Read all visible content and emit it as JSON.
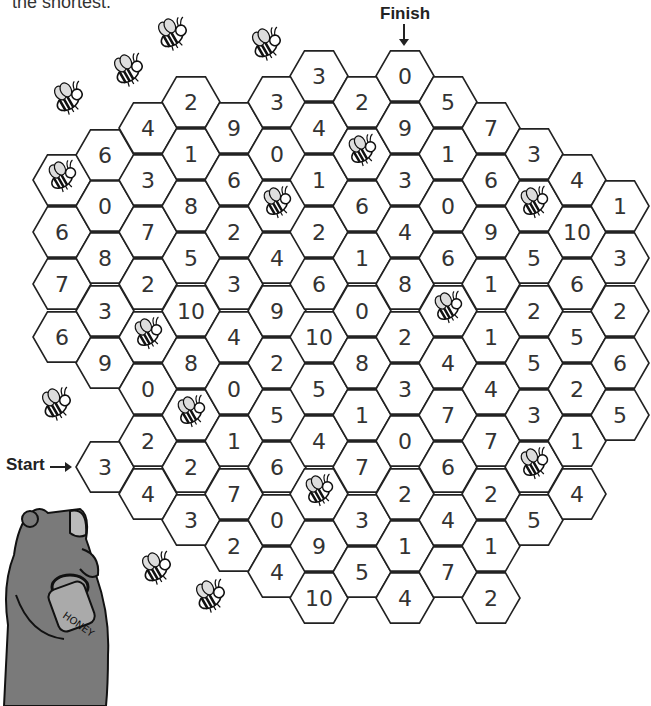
{
  "instructions_fragment": "the shortest.",
  "labels": {
    "finish": "Finish",
    "start": "Start"
  },
  "colors": {
    "hex_stroke": "#222222",
    "bear": "#7a7a7a",
    "text": "#333333"
  },
  "grid": {
    "hex_radius": 29,
    "cells": [
      {
        "x": 62,
        "y": 180,
        "v": "bee"
      },
      {
        "x": 62,
        "y": 232,
        "v": "6"
      },
      {
        "x": 62,
        "y": 284,
        "v": "7"
      },
      {
        "x": 62,
        "y": 337,
        "v": "6"
      },
      {
        "x": 105,
        "y": 155,
        "v": "6"
      },
      {
        "x": 105,
        "y": 206,
        "v": "0"
      },
      {
        "x": 105,
        "y": 258,
        "v": "8"
      },
      {
        "x": 105,
        "y": 311,
        "v": "3"
      },
      {
        "x": 105,
        "y": 363,
        "v": "9"
      },
      {
        "x": 105,
        "y": 467,
        "v": "3",
        "role": "start"
      },
      {
        "x": 148,
        "y": 128,
        "v": "4"
      },
      {
        "x": 148,
        "y": 180,
        "v": "3"
      },
      {
        "x": 148,
        "y": 232,
        "v": "7"
      },
      {
        "x": 148,
        "y": 284,
        "v": "2"
      },
      {
        "x": 148,
        "y": 337,
        "v": "bee"
      },
      {
        "x": 148,
        "y": 389,
        "v": "0"
      },
      {
        "x": 148,
        "y": 441,
        "v": "2"
      },
      {
        "x": 148,
        "y": 494,
        "v": "4"
      },
      {
        "x": 191,
        "y": 102,
        "v": "2"
      },
      {
        "x": 191,
        "y": 154,
        "v": "1"
      },
      {
        "x": 191,
        "y": 206,
        "v": "8"
      },
      {
        "x": 191,
        "y": 258,
        "v": "5"
      },
      {
        "x": 191,
        "y": 311,
        "v": "10"
      },
      {
        "x": 191,
        "y": 363,
        "v": "8"
      },
      {
        "x": 191,
        "y": 415,
        "v": "bee"
      },
      {
        "x": 191,
        "y": 467,
        "v": "2"
      },
      {
        "x": 191,
        "y": 520,
        "v": "3"
      },
      {
        "x": 234,
        "y": 128,
        "v": "9"
      },
      {
        "x": 234,
        "y": 180,
        "v": "6"
      },
      {
        "x": 234,
        "y": 232,
        "v": "2"
      },
      {
        "x": 234,
        "y": 284,
        "v": "3"
      },
      {
        "x": 234,
        "y": 337,
        "v": "4"
      },
      {
        "x": 234,
        "y": 389,
        "v": "0"
      },
      {
        "x": 234,
        "y": 441,
        "v": "1"
      },
      {
        "x": 234,
        "y": 494,
        "v": "7"
      },
      {
        "x": 234,
        "y": 546,
        "v": "2"
      },
      {
        "x": 277,
        "y": 102,
        "v": "3"
      },
      {
        "x": 277,
        "y": 154,
        "v": "0"
      },
      {
        "x": 277,
        "y": 206,
        "v": "bee"
      },
      {
        "x": 277,
        "y": 258,
        "v": "4"
      },
      {
        "x": 277,
        "y": 311,
        "v": "9"
      },
      {
        "x": 277,
        "y": 363,
        "v": "2"
      },
      {
        "x": 277,
        "y": 415,
        "v": "5"
      },
      {
        "x": 277,
        "y": 467,
        "v": "6"
      },
      {
        "x": 277,
        "y": 520,
        "v": "0"
      },
      {
        "x": 277,
        "y": 572,
        "v": "4"
      },
      {
        "x": 319,
        "y": 76,
        "v": "3"
      },
      {
        "x": 319,
        "y": 128,
        "v": "4"
      },
      {
        "x": 319,
        "y": 180,
        "v": "1"
      },
      {
        "x": 319,
        "y": 232,
        "v": "2"
      },
      {
        "x": 319,
        "y": 284,
        "v": "6"
      },
      {
        "x": 319,
        "y": 337,
        "v": "10"
      },
      {
        "x": 319,
        "y": 389,
        "v": "5"
      },
      {
        "x": 319,
        "y": 441,
        "v": "4"
      },
      {
        "x": 319,
        "y": 494,
        "v": "bee"
      },
      {
        "x": 319,
        "y": 546,
        "v": "9"
      },
      {
        "x": 319,
        "y": 598,
        "v": "10"
      },
      {
        "x": 362,
        "y": 102,
        "v": "2"
      },
      {
        "x": 362,
        "y": 154,
        "v": "bee"
      },
      {
        "x": 362,
        "y": 206,
        "v": "6"
      },
      {
        "x": 362,
        "y": 258,
        "v": "1"
      },
      {
        "x": 362,
        "y": 311,
        "v": "0"
      },
      {
        "x": 362,
        "y": 363,
        "v": "8"
      },
      {
        "x": 362,
        "y": 415,
        "v": "1"
      },
      {
        "x": 362,
        "y": 467,
        "v": "7"
      },
      {
        "x": 362,
        "y": 520,
        "v": "3"
      },
      {
        "x": 362,
        "y": 572,
        "v": "5"
      },
      {
        "x": 405,
        "y": 76,
        "v": "0",
        "role": "finish"
      },
      {
        "x": 405,
        "y": 128,
        "v": "9"
      },
      {
        "x": 405,
        "y": 180,
        "v": "3"
      },
      {
        "x": 405,
        "y": 232,
        "v": "4"
      },
      {
        "x": 405,
        "y": 284,
        "v": "8"
      },
      {
        "x": 405,
        "y": 337,
        "v": "2"
      },
      {
        "x": 405,
        "y": 389,
        "v": "3"
      },
      {
        "x": 405,
        "y": 441,
        "v": "0"
      },
      {
        "x": 405,
        "y": 494,
        "v": "2"
      },
      {
        "x": 405,
        "y": 546,
        "v": "1"
      },
      {
        "x": 405,
        "y": 598,
        "v": "4"
      },
      {
        "x": 448,
        "y": 102,
        "v": "5"
      },
      {
        "x": 448,
        "y": 154,
        "v": "1"
      },
      {
        "x": 448,
        "y": 206,
        "v": "0"
      },
      {
        "x": 448,
        "y": 258,
        "v": "6"
      },
      {
        "x": 448,
        "y": 311,
        "v": "bee"
      },
      {
        "x": 448,
        "y": 363,
        "v": "4"
      },
      {
        "x": 448,
        "y": 415,
        "v": "7"
      },
      {
        "x": 448,
        "y": 467,
        "v": "6"
      },
      {
        "x": 448,
        "y": 520,
        "v": "4"
      },
      {
        "x": 448,
        "y": 572,
        "v": "7"
      },
      {
        "x": 491,
        "y": 128,
        "v": "7"
      },
      {
        "x": 491,
        "y": 180,
        "v": "6"
      },
      {
        "x": 491,
        "y": 232,
        "v": "9"
      },
      {
        "x": 491,
        "y": 284,
        "v": "1"
      },
      {
        "x": 491,
        "y": 337,
        "v": "1"
      },
      {
        "x": 491,
        "y": 389,
        "v": "4"
      },
      {
        "x": 491,
        "y": 441,
        "v": "7"
      },
      {
        "x": 491,
        "y": 494,
        "v": "2"
      },
      {
        "x": 491,
        "y": 546,
        "v": "1"
      },
      {
        "x": 491,
        "y": 598,
        "v": "2"
      },
      {
        "x": 534,
        "y": 154,
        "v": "3"
      },
      {
        "x": 534,
        "y": 206,
        "v": "bee"
      },
      {
        "x": 534,
        "y": 258,
        "v": "5"
      },
      {
        "x": 534,
        "y": 311,
        "v": "2"
      },
      {
        "x": 534,
        "y": 363,
        "v": "5"
      },
      {
        "x": 534,
        "y": 415,
        "v": "3"
      },
      {
        "x": 534,
        "y": 467,
        "v": "bee"
      },
      {
        "x": 534,
        "y": 520,
        "v": "5"
      },
      {
        "x": 577,
        "y": 180,
        "v": "4"
      },
      {
        "x": 577,
        "y": 232,
        "v": "10"
      },
      {
        "x": 577,
        "y": 284,
        "v": "6"
      },
      {
        "x": 577,
        "y": 337,
        "v": "5"
      },
      {
        "x": 577,
        "y": 389,
        "v": "2"
      },
      {
        "x": 577,
        "y": 441,
        "v": "1"
      },
      {
        "x": 577,
        "y": 494,
        "v": "4"
      },
      {
        "x": 620,
        "y": 206,
        "v": "1"
      },
      {
        "x": 620,
        "y": 258,
        "v": "3"
      },
      {
        "x": 620,
        "y": 311,
        "v": "2"
      },
      {
        "x": 620,
        "y": 363,
        "v": "6"
      },
      {
        "x": 620,
        "y": 415,
        "v": "5"
      }
    ]
  },
  "loose_bees": [
    {
      "x": 172,
      "y": 38
    },
    {
      "x": 128,
      "y": 74
    },
    {
      "x": 68,
      "y": 102
    },
    {
      "x": 266,
      "y": 48
    },
    {
      "x": 56,
      "y": 408
    },
    {
      "x": 156,
      "y": 572
    },
    {
      "x": 210,
      "y": 600
    }
  ],
  "bear": {
    "jar_label": "HONEY"
  }
}
